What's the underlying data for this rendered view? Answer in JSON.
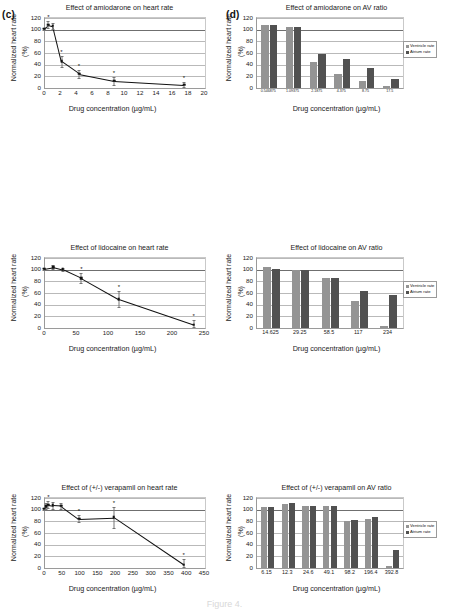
{
  "figure": {
    "panel_c_letter": "(c)",
    "panel_d_letter": "(d)",
    "caption": "Figure 4.",
    "axis": {
      "ylabel_main": "Normalized heart rate",
      "ylabel_unit": "(%)",
      "xlabel": "Drug concentration (µg/mL)"
    },
    "legend": {
      "ventricle": "Ventricle rate",
      "atrium": "Atrium rate"
    },
    "colors": {
      "ventricle": "#949494",
      "atrium": "#515151",
      "line": "#111111",
      "grid": "#b9b9b9"
    }
  },
  "chart_data": [
    {
      "type": "line",
      "panel": "c1",
      "title": "Effect of amiodarone on heart rate",
      "xlabel": "Drug concentration (µg/mL)",
      "ylabel": "Normalized heart rate (%)",
      "xlim": [
        0,
        20
      ],
      "ylim": [
        0,
        120
      ],
      "xticks": [
        0,
        2,
        4,
        6,
        8,
        10,
        12,
        14,
        16,
        18,
        20
      ],
      "yticks": [
        0,
        20,
        40,
        60,
        80,
        100,
        120
      ],
      "x": [
        0,
        0.546875,
        1.09375,
        2.1875,
        4.375,
        8.75,
        17.5
      ],
      "values": [
        100,
        107,
        105,
        44,
        23,
        11,
        4
      ],
      "errors": [
        2,
        6,
        5,
        9,
        7,
        7,
        4
      ],
      "significant": [
        false,
        true,
        false,
        true,
        true,
        true,
        true
      ]
    },
    {
      "type": "bar",
      "panel": "d1",
      "title": "Effect of amiodarone on AV ratio",
      "xlabel": "Drug concentration (µg/mL)",
      "ylabel": "Normalized heart rate (%)",
      "ylim": [
        0,
        120
      ],
      "yticks": [
        0,
        20,
        40,
        60,
        80,
        100,
        120
      ],
      "categories": [
        "0.546875",
        "1.09375",
        "2.1875",
        "4.375",
        "8.75",
        "17.5"
      ],
      "series": [
        {
          "name": "Ventricle rate",
          "values": [
            108,
            104,
            44,
            24,
            12,
            4
          ]
        },
        {
          "name": "Atrium rate",
          "values": [
            108,
            104,
            59,
            49,
            35,
            15
          ]
        }
      ]
    },
    {
      "type": "line",
      "panel": "c2",
      "title": "Effect of lidocaine on heart rate",
      "xlabel": "Drug concentration (µg/mL)",
      "ylabel": "Normalized heart rate (%)",
      "xlim": [
        0,
        250
      ],
      "ylim": [
        0,
        120
      ],
      "xticks": [
        0,
        50,
        100,
        150,
        200,
        250
      ],
      "yticks": [
        0,
        20,
        40,
        60,
        80,
        100,
        120
      ],
      "x": [
        0,
        14.625,
        29.25,
        58.5,
        117,
        234
      ],
      "values": [
        100,
        103,
        99,
        84,
        48,
        4
      ],
      "errors": [
        2,
        3,
        3,
        8,
        14,
        8
      ],
      "significant": [
        false,
        false,
        false,
        true,
        true,
        true
      ]
    },
    {
      "type": "bar",
      "panel": "d2",
      "title": "Effect of lidocaine on AV ratio",
      "xlabel": "Drug concentration (µg/mL)",
      "ylabel": "Normalized heart rate (%)",
      "ylim": [
        0,
        120
      ],
      "yticks": [
        0,
        20,
        40,
        60,
        80,
        100,
        120
      ],
      "categories": [
        "14.625",
        "29.25",
        "58.5",
        "117",
        "234"
      ],
      "series": [
        {
          "name": "Ventricle rate",
          "values": [
            104,
            100,
            85,
            47,
            4
          ]
        },
        {
          "name": "Atrium rate",
          "values": [
            102,
            99,
            85,
            63,
            56
          ]
        }
      ]
    },
    {
      "type": "line",
      "panel": "c3",
      "title": "Effect of (+/-) verapamil on heart rate",
      "xlabel": "Drug concentration (µg/mL)",
      "ylabel": "Normalized heart rate (%)",
      "xlim": [
        0,
        450
      ],
      "ylim": [
        0,
        120
      ],
      "xticks": [
        0,
        50,
        100,
        150,
        200,
        250,
        300,
        350,
        400,
        450
      ],
      "yticks": [
        0,
        20,
        40,
        60,
        80,
        100,
        120
      ],
      "x": [
        0,
        6.15,
        12.3,
        24.6,
        49.1,
        98.2,
        196.4,
        392.8
      ],
      "values": [
        100,
        104,
        107,
        106,
        105,
        83,
        85,
        4
      ],
      "errors": [
        2,
        5,
        6,
        6,
        5,
        6,
        18,
        10
      ],
      "significant": [
        false,
        false,
        true,
        false,
        false,
        true,
        true,
        true
      ]
    },
    {
      "type": "bar",
      "panel": "d3",
      "title": "Effect of (+/-) verapamil on AV ratio",
      "xlabel": "Drug concentration (µg/mL)",
      "ylabel": "Normalized heart rate (%)",
      "ylim": [
        0,
        120
      ],
      "yticks": [
        0,
        20,
        40,
        60,
        80,
        100,
        120
      ],
      "categories": [
        "6.15",
        "12.3",
        "24.6",
        "49.1",
        "98.2",
        "196.4",
        "392.8"
      ],
      "series": [
        {
          "name": "Ventricle rate",
          "values": [
            104,
            110,
            107,
            106,
            81,
            84,
            4
          ]
        },
        {
          "name": "Atrium rate",
          "values": [
            104,
            112,
            107,
            106,
            82,
            87,
            31
          ]
        }
      ]
    },
    {
      "type": "line",
      "panel": "c4",
      "title": "Effect of haloperidol on heart rate",
      "xlabel": "Drug concentration (µg/mL)",
      "ylabel": "Normalized heart rate (%)",
      "xlim": [
        0,
        25
      ],
      "ylim": [
        0,
        120
      ],
      "xticks": [
        0,
        5,
        10,
        15,
        20,
        25
      ],
      "yticks": [
        0,
        20,
        40,
        60,
        80,
        100,
        120
      ],
      "x": [
        0,
        0.1765625,
        0.353125,
        0.70625,
        1.4125,
        2.825,
        5.65,
        11.3,
        22.6
      ],
      "values": [
        100,
        101,
        102,
        102,
        43,
        26,
        1,
        1,
        1
      ],
      "errors": [
        2,
        3,
        3,
        3,
        14,
        13,
        2,
        2,
        2
      ],
      "significant": [
        false,
        false,
        false,
        false,
        true,
        true,
        true,
        true,
        true
      ]
    },
    {
      "type": "bar",
      "panel": "d4",
      "title": "Effect of haloperidol on AV ratio",
      "xlabel": "Drug concentration (µg/mL)",
      "ylabel": "Normalized heart rate (%)",
      "ylim": [
        0,
        120
      ],
      "yticks": [
        0,
        20,
        40,
        60,
        80,
        100,
        120
      ],
      "categories": [
        "0.1765625",
        "0.353125",
        "0.70625",
        "1.4125",
        "2.825",
        "5.65",
        "11.3",
        "22.6"
      ],
      "series": [
        {
          "name": "Ventricle rate",
          "values": [
            100,
            100,
            101,
            43,
            26,
            0,
            1,
            0
          ]
        },
        {
          "name": "Atrium rate",
          "values": [
            100,
            100,
            101,
            88,
            82,
            81,
            72,
            42
          ]
        }
      ]
    },
    {
      "type": "line",
      "panel": "c5",
      "title": "Effect of clomipramine on heart rate",
      "xlabel": "Drug concentration (µg/mL)",
      "ylabel": "Normalized heart rate (%)",
      "xlim": [
        0,
        250
      ],
      "ylim": [
        0,
        120
      ],
      "xticks": [
        0,
        50,
        100,
        150,
        200,
        250
      ],
      "yticks": [
        0,
        20,
        40,
        60,
        80,
        100,
        120
      ],
      "x": [
        0,
        0.875,
        1.75,
        3.5,
        7,
        14,
        28,
        56,
        112,
        224
      ],
      "values": [
        100,
        104,
        103,
        103,
        102,
        100,
        90,
        73,
        39,
        1
      ],
      "errors": [
        2,
        5,
        5,
        5,
        5,
        5,
        10,
        11,
        9,
        3
      ],
      "significant": [
        false,
        false,
        false,
        false,
        false,
        false,
        true,
        true,
        true,
        true
      ]
    },
    {
      "type": "bar",
      "panel": "d5",
      "title": "Effect of clomipramine on AV ratio",
      "xlabel": "Drug concentration (µg/mL)",
      "ylabel": "Normalized heart rate (%)",
      "ylim": [
        0,
        120
      ],
      "yticks": [
        0,
        20,
        40,
        60,
        80,
        100,
        120
      ],
      "categories": [
        "0.875",
        "1.75",
        "3.5",
        "7",
        "14",
        "28",
        "56",
        "112"
      ],
      "series": [
        {
          "name": "Ventricle rate",
          "values": [
            100,
            105,
            101,
            102,
            99,
            90,
            71,
            39
          ]
        },
        {
          "name": "Atrium rate",
          "values": [
            100,
            105,
            101,
            103,
            99,
            90,
            71,
            39
          ]
        }
      ]
    }
  ]
}
